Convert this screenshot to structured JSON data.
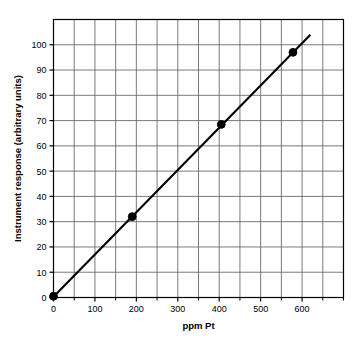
{
  "chart_data": {
    "type": "scatter",
    "title": "",
    "xlabel": "ppm Pt",
    "ylabel": "Instrument response (arbitrary units)",
    "xlim": [
      0,
      700
    ],
    "ylim": [
      0,
      110
    ],
    "xticks": [
      0,
      100,
      200,
      300,
      400,
      500,
      600
    ],
    "yticks": [
      0,
      10,
      20,
      30,
      40,
      50,
      60,
      70,
      80,
      90,
      100
    ],
    "xtick_labels": [
      "0",
      "100",
      "200",
      "300",
      "400",
      "500",
      "600"
    ],
    "ytick_labels": [
      "0",
      "10",
      "20",
      "30",
      "40",
      "50",
      "60",
      "70",
      "80",
      "90",
      "100"
    ],
    "x_minor_step": 50,
    "y_minor_step": 10,
    "grid": true,
    "legend": null,
    "series": [
      {
        "name": "calibration points",
        "marker": "filled-circle",
        "color": "#000000",
        "points": [
          {
            "x": 0,
            "y": 0.5
          },
          {
            "x": 190,
            "y": 32.0
          },
          {
            "x": 405,
            "y": 68.5
          },
          {
            "x": 578,
            "y": 97.0
          }
        ]
      },
      {
        "name": "fitted line",
        "marker": "none",
        "color": "#000000",
        "points": [
          {
            "x": 0,
            "y": 0.3
          },
          {
            "x": 620,
            "y": 104.0
          }
        ]
      }
    ],
    "colors": {
      "axis": "#000000",
      "grid": "#6b6b6b",
      "marker": "#000000",
      "line": "#000000",
      "background": "#ffffff"
    }
  }
}
